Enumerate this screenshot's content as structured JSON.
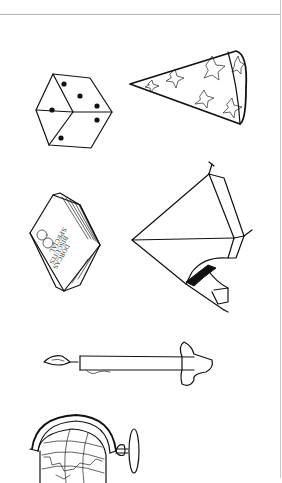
{
  "sheet": {
    "background": "#ffffff",
    "ink_color": "#111111",
    "rule_color": "#b5b5b5"
  },
  "objects": [
    {
      "id": "die",
      "label": "Die",
      "pips_visible": [
        3,
        2,
        1
      ]
    },
    {
      "id": "party-hat",
      "label": "Party hat with stars"
    },
    {
      "id": "box",
      "label": "Box",
      "text_lines": [
        "DORCAS",
        "BISCUITS",
        "SPECIAL"
      ]
    },
    {
      "id": "tent",
      "label": "Tent"
    },
    {
      "id": "candle",
      "label": "Candle in holder"
    },
    {
      "id": "globe",
      "label": "Globe"
    }
  ]
}
